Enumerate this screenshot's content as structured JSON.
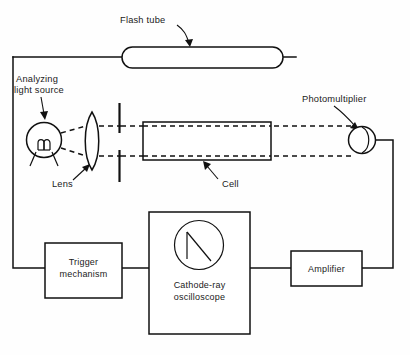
{
  "figure": {
    "background_color": "#fefefe",
    "line_color": "#111111",
    "text_color": "#1a1a1a"
  },
  "labels": {
    "flash_tube": "Flash tube",
    "analyzing_light_source_line1": "Analyzing",
    "analyzing_light_source_line2": "light source",
    "photomultiplier": "Photomultiplier",
    "lens": "Lens",
    "cell": "Cell"
  },
  "boxes": {
    "trigger": {
      "line1": "Trigger",
      "line2": "mechanism"
    },
    "oscilloscope": {
      "line1": "Cathode-ray",
      "line2": "oscilloscope"
    },
    "amplifier": {
      "line1": "Amplifier"
    }
  },
  "components": {
    "flash_tube_shape": "stadium-tube",
    "light_source_shape": "filament-lamp-circle",
    "lens_shape": "biconvex-lens",
    "slit_shape": "double-bar-aperture",
    "cell_shape": "rectangular-cuvette",
    "photomultiplier_shape": "circle-with-crescent",
    "crt_screen_shape": "circle-with-decay-trace"
  }
}
